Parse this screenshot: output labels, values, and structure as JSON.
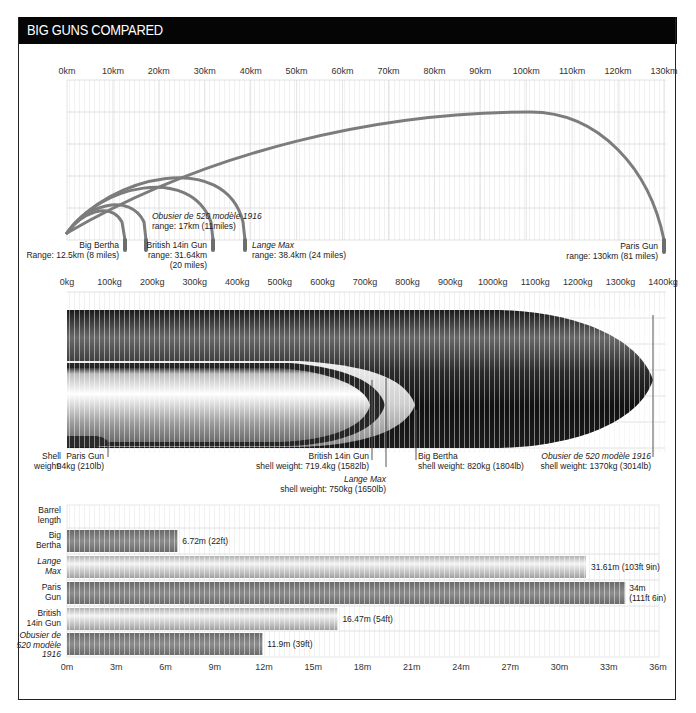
{
  "title": "BIG GUNS COMPARED",
  "colors": {
    "title_bg": "#050505",
    "title_fg": "#ffffff",
    "trajectory": "#7a7a7a",
    "grid": "#e6e6e6"
  },
  "chart_data": [
    {
      "type": "line",
      "title": "Range (trajectory arcs)",
      "xlabel": "Range (km)",
      "x_ticks": [
        "0km",
        "10km",
        "20km",
        "30km",
        "40km",
        "50km",
        "60km",
        "70km",
        "80km",
        "90km",
        "100km",
        "110km",
        "120km",
        "130km"
      ],
      "xlim": [
        0,
        130
      ],
      "series": [
        {
          "name": "Big Bertha",
          "range_km": 12.5,
          "label": "Big Bertha",
          "sublabel": "Range: 12.5km (8 miles)"
        },
        {
          "name": "Obusier de 520 modèle 1916",
          "range_km": 17,
          "label": "Obusier de 520 modèle 1916",
          "sublabel": "range: 17km (11miles)"
        },
        {
          "name": "British 14in Gun",
          "range_km": 31.64,
          "label": "British 14in Gun",
          "sublabel": "range: 31.64km",
          "sublabel2": "(20 miles)"
        },
        {
          "name": "Lange Max",
          "range_km": 38.4,
          "label": "Lange Max",
          "sublabel": "range: 38.4km (24 miles)"
        },
        {
          "name": "Paris Gun",
          "range_km": 130,
          "label": "Paris Gun",
          "sublabel": "range: 130km (81 miles)"
        }
      ]
    },
    {
      "type": "area",
      "title": "Shell weight (overlapping shell silhouettes)",
      "xlabel": "Shell weight (kg)",
      "x_ticks": [
        "0kg",
        "100kg",
        "200kg",
        "300kg",
        "400kg",
        "500kg",
        "600kg",
        "700kg",
        "800kg",
        "900kg",
        "1000kg",
        "1100kg",
        "1200kg",
        "1300kg",
        "1400kg"
      ],
      "xlim": [
        0,
        1400
      ],
      "axis_label": "Shell weight:",
      "axis_label_line1": "Shell",
      "axis_label_line2": "weight:",
      "series": [
        {
          "name": "Paris Gun",
          "weight_kg": 94,
          "label": "Paris Gun",
          "sublabel": "94kg (210lb)"
        },
        {
          "name": "British 14in Gun",
          "weight_kg": 719.4,
          "label": "British 14in Gun",
          "sublabel": "shell weight: 719.4kg (1582lb)"
        },
        {
          "name": "Lange Max",
          "weight_kg": 750,
          "label": "Lange Max",
          "sublabel": "shell weight: 750kg (1650lb)"
        },
        {
          "name": "Big Bertha",
          "weight_kg": 820,
          "label": "Big Bertha",
          "sublabel": "shell weight: 820kg (1804lb)"
        },
        {
          "name": "Obusier de 520 modèle 1916",
          "weight_kg": 1370,
          "label": "Obusier de 520 modèle 1916",
          "sublabel": "shell weight: 1370kg (3014lb)"
        }
      ]
    },
    {
      "type": "bar",
      "title": "Barrel length",
      "header_line1": "Barrel",
      "header_line2": "length",
      "xlabel": "Barrel length (m)",
      "x_ticks": [
        "0m",
        "3m",
        "6m",
        "9m",
        "12m",
        "15m",
        "18m",
        "21m",
        "24m",
        "27m",
        "30m",
        "33m",
        "36m"
      ],
      "xlim": [
        0,
        36
      ],
      "categories": [
        "Big Bertha",
        "Lange Max",
        "Paris Gun",
        "British 14in Gun",
        "Obusier de 520 modèle 1916"
      ],
      "values": [
        6.72,
        31.61,
        34,
        16.47,
        11.9
      ],
      "rows": [
        {
          "line1": "Big",
          "line2": "Bertha",
          "line3": "",
          "italic": false,
          "value": 6.72,
          "label": "6.72m (22ft)",
          "label2": "",
          "style": "dark"
        },
        {
          "line1": "Lange",
          "line2": "Max",
          "line3": "",
          "italic": true,
          "value": 31.61,
          "label": "31.61m (103ft 9in)",
          "label2": "",
          "style": "light"
        },
        {
          "line1": "Paris",
          "line2": "Gun",
          "line3": "",
          "italic": false,
          "value": 34,
          "label": "34m",
          "label2": "(111ft 6in)",
          "style": "dark"
        },
        {
          "line1": "British",
          "line2": "14in Gun",
          "line3": "",
          "italic": false,
          "value": 16.47,
          "label": "16.47m (54ft)",
          "label2": "",
          "style": "light"
        },
        {
          "line1": "Obusier de",
          "line2": "520 modèle",
          "line3": "1916",
          "italic": true,
          "value": 11.9,
          "label": "11.9m (39ft)",
          "label2": "",
          "style": "dark"
        }
      ]
    }
  ]
}
